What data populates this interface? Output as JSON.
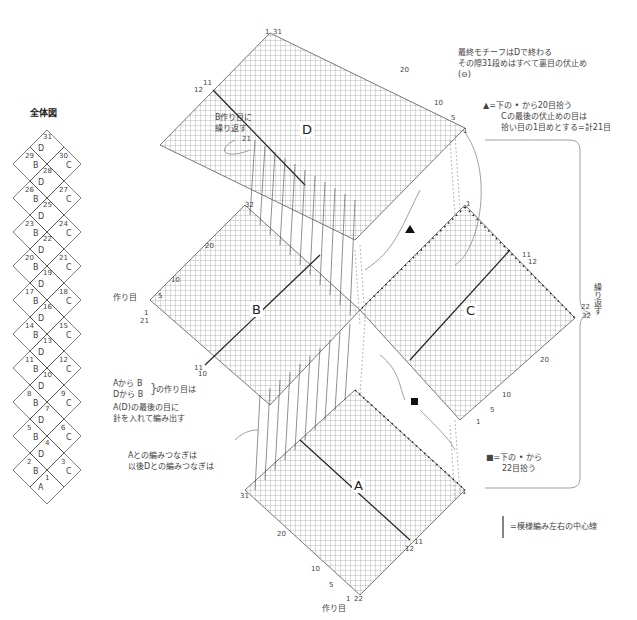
{
  "overview": {
    "title": "全体図",
    "motifs": [
      {
        "n": "31",
        "letter": "D"
      },
      {
        "n": "29",
        "letter": "B"
      },
      {
        "n": "30",
        "letter": "C"
      },
      {
        "n": "28",
        "letter": "D"
      },
      {
        "n": "26",
        "letter": "B"
      },
      {
        "n": "27",
        "letter": "C"
      },
      {
        "n": "25",
        "letter": "D"
      },
      {
        "n": "23",
        "letter": "B"
      },
      {
        "n": "24",
        "letter": "C"
      },
      {
        "n": "22",
        "letter": "D"
      },
      {
        "n": "20",
        "letter": "B"
      },
      {
        "n": "21",
        "letter": "C"
      },
      {
        "n": "19",
        "letter": "D"
      },
      {
        "n": "17",
        "letter": "B"
      },
      {
        "n": "18",
        "letter": "C"
      },
      {
        "n": "16",
        "letter": "D"
      },
      {
        "n": "14",
        "letter": "B"
      },
      {
        "n": "15",
        "letter": "C"
      },
      {
        "n": "13",
        "letter": "D"
      },
      {
        "n": "11",
        "letter": "B"
      },
      {
        "n": "12",
        "letter": "C"
      },
      {
        "n": "10",
        "letter": "D"
      },
      {
        "n": "8",
        "letter": "B"
      },
      {
        "n": "9",
        "letter": "C"
      },
      {
        "n": "7",
        "letter": "D"
      },
      {
        "n": "5",
        "letter": "B"
      },
      {
        "n": "6",
        "letter": "C"
      },
      {
        "n": "4",
        "letter": "D"
      },
      {
        "n": "2",
        "letter": "B"
      },
      {
        "n": "3",
        "letter": "C"
      },
      {
        "n": "1",
        "letter": "A"
      }
    ]
  },
  "notes": {
    "final_motif_1": "最終モチーフはDで終わる",
    "final_motif_2": "その際31段めはすべて裏目の伏止め",
    "final_motif_3": "(⊖)",
    "triangle_1": "▲=下の • から20目拾う",
    "triangle_2": "Cの最後の伏止めの目は",
    "triangle_3": "拾い目の1目めとする=計21目",
    "b_repeat_1": "B作り目に",
    "b_repeat_2": "繰り返す",
    "repeat_vertical": "繰り返す",
    "cast_on_1": "Aから B",
    "cast_on_2": "Dから B",
    "cast_on_brace": "の作り目は",
    "cast_on_3": "A(D)の最後の目に",
    "cast_on_4": "針を入れて編み出す",
    "join_1": "Aとの編みつなぎは",
    "join_2": "以後Dとの編みつなぎは",
    "square_1": "■=下の • から",
    "square_2": "22目拾う",
    "legend_line": "=模様編み左右の中心線",
    "cast_on_label_b": "作り目",
    "cast_on_label_a": "作り目"
  },
  "motifs": {
    "A": {
      "label": "A",
      "labels": [
        "31",
        "20",
        "10",
        "5",
        "1",
        "22",
        "11",
        "12",
        "1"
      ]
    },
    "B": {
      "label": "B",
      "labels": [
        "32",
        "20",
        "10",
        "5",
        "1",
        "21",
        "11",
        "10"
      ]
    },
    "C": {
      "label": "C",
      "labels": [
        "1",
        "11",
        "12",
        "22",
        "32",
        "20",
        "10",
        "5",
        "1"
      ]
    },
    "D": {
      "label": "D",
      "labels": [
        "1",
        "31",
        "20",
        "10",
        "5",
        "1",
        "11",
        "12",
        "21"
      ]
    }
  }
}
